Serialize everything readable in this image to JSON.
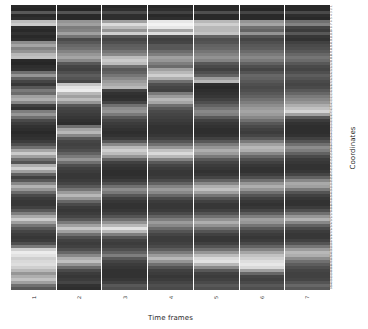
{
  "chart_data": {
    "type": "heatmap",
    "title": "",
    "xlabel": "Time frames",
    "ylabel": "Coordinates",
    "colormap": "grayscale",
    "color_low": "#111111",
    "color_high": "#ffffff",
    "grid": false,
    "legend": "none",
    "x_categories": [
      "1",
      "2",
      "3",
      "4",
      "5",
      "6",
      "7"
    ],
    "y_categories": [
      "1",
      "2",
      "3",
      "4",
      "5",
      "6",
      "7",
      "8",
      "9",
      "10",
      "11",
      "12",
      "13",
      "14",
      "15",
      "16",
      "17",
      "18",
      "19",
      "20",
      "21",
      "22",
      "23",
      "24",
      "25",
      "26",
      "27",
      "28",
      "29",
      "30",
      "31",
      "32",
      "33",
      "34",
      "35",
      "36",
      "37",
      "38",
      "39",
      "40",
      "41",
      "42",
      "43",
      "44",
      "45",
      "46",
      "47",
      "48",
      "49",
      "50",
      "51",
      "52",
      "53",
      "54",
      "55",
      "56",
      "57",
      "58",
      "59",
      "60",
      "61",
      "62",
      "63",
      "64",
      "65",
      "66",
      "67",
      "68",
      "69",
      "70",
      "71",
      "72",
      "73",
      "74",
      "75",
      "76",
      "77",
      "78",
      "79",
      "80",
      "81",
      "82",
      "83",
      "84",
      "85",
      "86",
      "87",
      "88",
      "89",
      "90",
      "91",
      "92",
      "93",
      "94",
      "95"
    ],
    "value_range": [
      0,
      1
    ],
    "values": [
      [
        0.1,
        0.1,
        0.1,
        0.1,
        0.1,
        0.1,
        0.1
      ],
      [
        0.09,
        0.09,
        0.12,
        0.12,
        0.1,
        0.09,
        0.1
      ],
      [
        0.3,
        0.28,
        0.24,
        0.2,
        0.26,
        0.22,
        0.24
      ],
      [
        0.1,
        0.1,
        0.12,
        0.1,
        0.1,
        0.1,
        0.12
      ],
      [
        0.12,
        0.1,
        0.12,
        0.12,
        0.1,
        0.1,
        0.1
      ],
      [
        0.72,
        0.55,
        0.6,
        0.9,
        0.7,
        0.55,
        0.4
      ],
      [
        0.78,
        0.6,
        0.85,
        0.95,
        0.8,
        0.62,
        0.48
      ],
      [
        0.12,
        0.45,
        0.72,
        0.9,
        0.7,
        0.4,
        0.22
      ],
      [
        0.1,
        0.48,
        0.55,
        0.62,
        0.7,
        0.35,
        0.18
      ],
      [
        0.14,
        0.6,
        0.8,
        0.86,
        0.75,
        0.55,
        0.3
      ],
      [
        0.1,
        0.42,
        0.3,
        0.26,
        0.35,
        0.28,
        0.16
      ],
      [
        0.12,
        0.24,
        0.22,
        0.2,
        0.26,
        0.22,
        0.14
      ],
      [
        0.52,
        0.3,
        0.26,
        0.22,
        0.28,
        0.26,
        0.2
      ],
      [
        0.62,
        0.36,
        0.32,
        0.3,
        0.34,
        0.3,
        0.24
      ],
      [
        0.48,
        0.4,
        0.34,
        0.3,
        0.36,
        0.32,
        0.26
      ],
      [
        0.55,
        0.48,
        0.42,
        0.38,
        0.42,
        0.38,
        0.3
      ],
      [
        0.7,
        0.56,
        0.5,
        0.46,
        0.48,
        0.44,
        0.36
      ],
      [
        0.74,
        0.62,
        0.72,
        0.6,
        0.54,
        0.5,
        0.42
      ],
      [
        0.1,
        0.5,
        0.78,
        0.56,
        0.48,
        0.44,
        0.38
      ],
      [
        0.09,
        0.3,
        0.72,
        0.46,
        0.3,
        0.34,
        0.3
      ],
      [
        0.12,
        0.22,
        0.4,
        0.38,
        0.24,
        0.26,
        0.24
      ],
      [
        0.14,
        0.2,
        0.3,
        0.6,
        0.2,
        0.22,
        0.22
      ],
      [
        0.4,
        0.26,
        0.34,
        0.7,
        0.26,
        0.28,
        0.26
      ],
      [
        0.56,
        0.32,
        0.42,
        0.8,
        0.34,
        0.36,
        0.32
      ],
      [
        0.34,
        0.28,
        0.5,
        0.66,
        0.58,
        0.34,
        0.28
      ],
      [
        0.22,
        0.22,
        0.58,
        0.4,
        0.7,
        0.3,
        0.24
      ],
      [
        0.16,
        0.75,
        0.64,
        0.26,
        0.12,
        0.26,
        0.22
      ],
      [
        0.3,
        0.88,
        0.7,
        0.22,
        0.1,
        0.24,
        0.24
      ],
      [
        0.44,
        0.92,
        0.2,
        0.2,
        0.12,
        0.26,
        0.3
      ],
      [
        0.38,
        0.7,
        0.14,
        0.44,
        0.14,
        0.3,
        0.36
      ],
      [
        0.6,
        0.6,
        0.12,
        0.58,
        0.16,
        0.34,
        0.44
      ],
      [
        0.66,
        0.72,
        0.14,
        0.7,
        0.2,
        0.4,
        0.5
      ],
      [
        0.5,
        0.56,
        0.22,
        0.62,
        0.26,
        0.46,
        0.56
      ],
      [
        0.2,
        0.3,
        0.4,
        0.4,
        0.34,
        0.52,
        0.66
      ],
      [
        0.14,
        0.22,
        0.52,
        0.3,
        0.42,
        0.58,
        0.74
      ],
      [
        0.46,
        0.2,
        0.56,
        0.24,
        0.5,
        0.62,
        0.82
      ],
      [
        0.56,
        0.18,
        0.44,
        0.22,
        0.46,
        0.58,
        0.6
      ],
      [
        0.4,
        0.16,
        0.3,
        0.2,
        0.3,
        0.5,
        0.3
      ],
      [
        0.24,
        0.14,
        0.22,
        0.18,
        0.2,
        0.4,
        0.18
      ],
      [
        0.18,
        0.12,
        0.18,
        0.16,
        0.16,
        0.3,
        0.14
      ],
      [
        0.14,
        0.4,
        0.16,
        0.14,
        0.14,
        0.24,
        0.12
      ],
      [
        0.12,
        0.62,
        0.14,
        0.14,
        0.12,
        0.2,
        0.12
      ],
      [
        0.1,
        0.7,
        0.12,
        0.14,
        0.12,
        0.18,
        0.12
      ],
      [
        0.12,
        0.5,
        0.14,
        0.16,
        0.14,
        0.22,
        0.14
      ],
      [
        0.14,
        0.3,
        0.18,
        0.2,
        0.2,
        0.3,
        0.2
      ],
      [
        0.18,
        0.22,
        0.3,
        0.28,
        0.3,
        0.44,
        0.28
      ],
      [
        0.26,
        0.2,
        0.5,
        0.4,
        0.44,
        0.6,
        0.4
      ],
      [
        0.4,
        0.22,
        0.7,
        0.56,
        0.56,
        0.7,
        0.52
      ],
      [
        0.62,
        0.26,
        0.8,
        0.74,
        0.66,
        0.66,
        0.46
      ],
      [
        0.78,
        0.34,
        0.72,
        0.84,
        0.58,
        0.5,
        0.34
      ],
      [
        0.6,
        0.44,
        0.56,
        0.7,
        0.44,
        0.36,
        0.24
      ],
      [
        0.4,
        0.56,
        0.34,
        0.48,
        0.3,
        0.26,
        0.18
      ],
      [
        0.28,
        0.4,
        0.2,
        0.3,
        0.22,
        0.2,
        0.16
      ],
      [
        0.66,
        0.26,
        0.16,
        0.22,
        0.18,
        0.16,
        0.14
      ],
      [
        0.8,
        0.2,
        0.14,
        0.18,
        0.16,
        0.14,
        0.14
      ],
      [
        0.6,
        0.18,
        0.12,
        0.16,
        0.14,
        0.14,
        0.16
      ],
      [
        0.34,
        0.16,
        0.12,
        0.16,
        0.16,
        0.18,
        0.22
      ],
      [
        0.2,
        0.16,
        0.14,
        0.18,
        0.22,
        0.26,
        0.34
      ],
      [
        0.3,
        0.18,
        0.18,
        0.24,
        0.34,
        0.4,
        0.5
      ],
      [
        0.5,
        0.22,
        0.26,
        0.34,
        0.5,
        0.56,
        0.64
      ],
      [
        0.68,
        0.3,
        0.4,
        0.48,
        0.66,
        0.66,
        0.6
      ],
      [
        0.56,
        0.42,
        0.52,
        0.58,
        0.74,
        0.56,
        0.44
      ],
      [
        0.38,
        0.58,
        0.44,
        0.5,
        0.6,
        0.4,
        0.28
      ],
      [
        0.24,
        0.7,
        0.3,
        0.36,
        0.42,
        0.28,
        0.2
      ],
      [
        0.18,
        0.56,
        0.2,
        0.24,
        0.28,
        0.2,
        0.16
      ],
      [
        0.16,
        0.36,
        0.16,
        0.18,
        0.2,
        0.16,
        0.14
      ],
      [
        0.16,
        0.24,
        0.14,
        0.16,
        0.16,
        0.14,
        0.14
      ],
      [
        0.2,
        0.18,
        0.14,
        0.16,
        0.16,
        0.16,
        0.18
      ],
      [
        0.3,
        0.16,
        0.16,
        0.18,
        0.2,
        0.22,
        0.26
      ],
      [
        0.46,
        0.18,
        0.2,
        0.24,
        0.28,
        0.32,
        0.4
      ],
      [
        0.64,
        0.22,
        0.28,
        0.34,
        0.4,
        0.46,
        0.56
      ],
      [
        0.78,
        0.3,
        0.4,
        0.46,
        0.54,
        0.6,
        0.68
      ],
      [
        0.6,
        0.44,
        0.54,
        0.58,
        0.66,
        0.56,
        0.5
      ],
      [
        0.42,
        0.6,
        0.7,
        0.5,
        0.54,
        0.42,
        0.34
      ],
      [
        0.3,
        0.76,
        0.88,
        0.38,
        0.4,
        0.3,
        0.24
      ],
      [
        0.22,
        0.6,
        0.7,
        0.28,
        0.28,
        0.22,
        0.18
      ],
      [
        0.18,
        0.4,
        0.46,
        0.22,
        0.2,
        0.18,
        0.16
      ],
      [
        0.16,
        0.26,
        0.28,
        0.18,
        0.16,
        0.16,
        0.16
      ],
      [
        0.18,
        0.2,
        0.2,
        0.18,
        0.16,
        0.18,
        0.2
      ],
      [
        0.26,
        0.18,
        0.18,
        0.2,
        0.2,
        0.24,
        0.28
      ],
      [
        0.44,
        0.2,
        0.2,
        0.24,
        0.28,
        0.34,
        0.42
      ],
      [
        0.8,
        0.26,
        0.26,
        0.32,
        0.4,
        0.48,
        0.58
      ],
      [
        0.92,
        0.36,
        0.34,
        0.44,
        0.56,
        0.62,
        0.7
      ],
      [
        0.88,
        0.5,
        0.46,
        0.58,
        0.72,
        0.74,
        0.66
      ],
      [
        0.8,
        0.66,
        0.3,
        0.7,
        0.84,
        0.8,
        0.52
      ],
      [
        0.84,
        0.74,
        0.22,
        0.56,
        0.88,
        0.86,
        0.4
      ],
      [
        0.86,
        0.56,
        0.18,
        0.4,
        0.7,
        0.9,
        0.32
      ],
      [
        0.8,
        0.38,
        0.16,
        0.28,
        0.5,
        0.84,
        0.26
      ],
      [
        0.7,
        0.24,
        0.14,
        0.2,
        0.3,
        0.6,
        0.22
      ],
      [
        0.56,
        0.18,
        0.14,
        0.18,
        0.2,
        0.36,
        0.2
      ],
      [
        0.66,
        0.16,
        0.14,
        0.16,
        0.18,
        0.22,
        0.2
      ],
      [
        0.74,
        0.18,
        0.16,
        0.18,
        0.2,
        0.2,
        0.22
      ],
      [
        0.6,
        0.22,
        0.2,
        0.22,
        0.24,
        0.24,
        0.28
      ],
      [
        0.4,
        0.14,
        0.3,
        0.26,
        0.3,
        0.3,
        0.36
      ],
      [
        0.3,
        0.12,
        0.26,
        0.24,
        0.26,
        0.26,
        0.3
      ]
    ]
  }
}
